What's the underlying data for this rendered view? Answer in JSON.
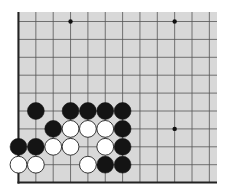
{
  "board": {
    "description": "Go board fragment (lower-left corner region)",
    "background_color": "#d8d8d8",
    "line_color": "#555555",
    "edge_color": "#222222",
    "columns": 12,
    "rows": 10,
    "visible_edges": [
      "left",
      "bottom"
    ],
    "star_points": [
      {
        "col": 3,
        "row": 0
      },
      {
        "col": 9,
        "row": 0
      },
      {
        "col": 9,
        "row": 6
      }
    ],
    "stones": [
      {
        "color": "black",
        "col": 1,
        "row": 5
      },
      {
        "color": "black",
        "col": 3,
        "row": 5
      },
      {
        "color": "black",
        "col": 4,
        "row": 5
      },
      {
        "color": "black",
        "col": 5,
        "row": 5
      },
      {
        "color": "black",
        "col": 6,
        "row": 5
      },
      {
        "color": "black",
        "col": 2,
        "row": 6
      },
      {
        "color": "white",
        "col": 3,
        "row": 6
      },
      {
        "color": "white",
        "col": 4,
        "row": 6
      },
      {
        "color": "white",
        "col": 5,
        "row": 6
      },
      {
        "color": "black",
        "col": 6,
        "row": 6
      },
      {
        "color": "black",
        "col": 0,
        "row": 7
      },
      {
        "color": "black",
        "col": 1,
        "row": 7
      },
      {
        "color": "white",
        "col": 2,
        "row": 7
      },
      {
        "color": "white",
        "col": 3,
        "row": 7
      },
      {
        "color": "white",
        "col": 5,
        "row": 7
      },
      {
        "color": "black",
        "col": 6,
        "row": 7
      },
      {
        "color": "white",
        "col": 0,
        "row": 8
      },
      {
        "color": "white",
        "col": 1,
        "row": 8
      },
      {
        "color": "white",
        "col": 4,
        "row": 8
      },
      {
        "color": "black",
        "col": 5,
        "row": 8
      },
      {
        "color": "black",
        "col": 6,
        "row": 8
      }
    ]
  }
}
